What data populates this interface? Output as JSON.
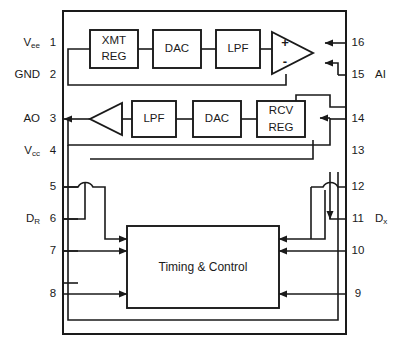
{
  "diagram": {
    "package": {
      "label": ""
    },
    "blocks": [
      {
        "id": "xmt_reg",
        "line1": "XMT",
        "line2": "REG"
      },
      {
        "id": "dac_top",
        "line1": "DAC",
        "line2": ""
      },
      {
        "id": "lpf_top",
        "line1": "LPF",
        "line2": ""
      },
      {
        "id": "lpf_bot",
        "line1": "LPF",
        "line2": ""
      },
      {
        "id": "dac_bot",
        "line1": "DAC",
        "line2": ""
      },
      {
        "id": "rcv_reg",
        "line1": "RCV",
        "line2": "REG"
      },
      {
        "id": "timing",
        "line1": "Timing & Control",
        "line2": ""
      }
    ],
    "opamp": {
      "plus_label": "+",
      "minus_label": "-"
    },
    "pins_left": [
      {
        "num": "1",
        "name": "V",
        "sub": "ee",
        "connected": false
      },
      {
        "num": "2",
        "name": "GND",
        "sub": "",
        "connected": false
      },
      {
        "num": "3",
        "name": "AO",
        "sub": "",
        "connected": true
      },
      {
        "num": "4",
        "name": "V",
        "sub": "cc",
        "connected": false
      },
      {
        "num": "5",
        "name": "",
        "sub": "",
        "connected": true
      },
      {
        "num": "6",
        "name": "D",
        "sub": "R",
        "connected": true
      },
      {
        "num": "7",
        "name": "",
        "sub": "",
        "connected": true
      },
      {
        "num": "8",
        "name": "",
        "sub": "",
        "connected": true
      }
    ],
    "pins_right": [
      {
        "num": "16",
        "name": "",
        "sub": "",
        "connected": true
      },
      {
        "num": "15",
        "name": "AI",
        "sub": "",
        "connected": true
      },
      {
        "num": "14",
        "name": "",
        "sub": "",
        "connected": true
      },
      {
        "num": "13",
        "name": "",
        "sub": "",
        "connected": true
      },
      {
        "num": "12",
        "name": "",
        "sub": "",
        "connected": true
      },
      {
        "num": "11",
        "name": "D",
        "sub": "x",
        "connected": true
      },
      {
        "num": "10",
        "name": "",
        "sub": "",
        "connected": true
      },
      {
        "num": "9",
        "name": "",
        "sub": "",
        "connected": true
      }
    ],
    "colors": {
      "line": "#1a1a1a",
      "background": "#ffffff",
      "block_fill": "#ffffff"
    }
  }
}
